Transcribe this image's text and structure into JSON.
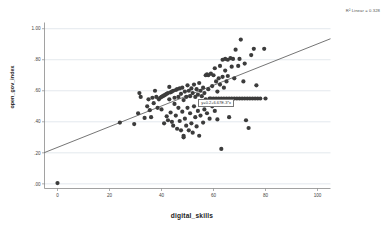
{
  "chart_data": {
    "type": "scatter",
    "title": "",
    "xlabel": "digital_skills",
    "ylabel": "open_gov_index",
    "xlim": [
      -5,
      105
    ],
    "ylim": [
      -0.03,
      1.04
    ],
    "xticks": [
      "0",
      "20",
      "40",
      "60",
      "80",
      "100"
    ],
    "xtick_values": [
      0,
      20,
      40,
      60,
      80,
      100
    ],
    "yticks": [
      "1.00",
      ".80",
      ".60",
      ".40",
      ".20",
      ".00"
    ],
    "ytick_values": [
      1.0,
      0.8,
      0.6,
      0.4,
      0.2,
      0.0
    ],
    "grid": "horizontal",
    "legend": "none",
    "r2_annotation": "R² Linear = 0.328",
    "r2_value": 0.328,
    "fit_equation_label": "y=0.2+6.67E-3*x",
    "fit_line": {
      "intercept": 0.235,
      "slope": 0.00667,
      "x_start": -5,
      "x_end": 105,
      "color": "#3a3a3a"
    },
    "marker": {
      "color": "#3c3c3c",
      "shape": "circle",
      "size": 2.1
    },
    "points": [
      [
        0.0,
        0.005
      ],
      [
        24.0,
        0.395
      ],
      [
        29.5,
        0.385
      ],
      [
        31.0,
        0.455
      ],
      [
        31.5,
        0.585
      ],
      [
        32.0,
        0.56
      ],
      [
        33.5,
        0.425
      ],
      [
        34.5,
        0.5
      ],
      [
        35.0,
        0.545
      ],
      [
        35.5,
        0.475
      ],
      [
        36.0,
        0.43
      ],
      [
        36.5,
        0.555
      ],
      [
        37.0,
        0.52
      ],
      [
        37.5,
        0.6
      ],
      [
        38.0,
        0.56
      ],
      [
        38.5,
        0.49
      ],
      [
        39.0,
        0.545
      ],
      [
        39.5,
        0.555
      ],
      [
        40.0,
        0.56
      ],
      [
        40.0,
        0.48
      ],
      [
        40.5,
        0.565
      ],
      [
        41.0,
        0.57
      ],
      [
        41.0,
        0.39
      ],
      [
        41.5,
        0.575
      ],
      [
        42.0,
        0.58
      ],
      [
        42.0,
        0.435
      ],
      [
        42.5,
        0.585
      ],
      [
        42.5,
        0.41
      ],
      [
        43.0,
        0.545
      ],
      [
        43.0,
        0.625
      ],
      [
        43.5,
        0.59
      ],
      [
        43.5,
        0.46
      ],
      [
        44.0,
        0.595
      ],
      [
        44.0,
        0.4
      ],
      [
        44.5,
        0.6
      ],
      [
        44.5,
        0.375
      ],
      [
        45.0,
        0.555
      ],
      [
        45.0,
        0.515
      ],
      [
        45.5,
        0.605
      ],
      [
        45.5,
        0.44
      ],
      [
        46.0,
        0.61
      ],
      [
        46.0,
        0.355
      ],
      [
        46.5,
        0.56
      ],
      [
        46.5,
        0.49
      ],
      [
        47.0,
        0.615
      ],
      [
        47.0,
        0.405
      ],
      [
        47.5,
        0.58
      ],
      [
        47.5,
        0.345
      ],
      [
        48.0,
        0.62
      ],
      [
        48.0,
        0.465
      ],
      [
        48.5,
        0.54
      ],
      [
        48.5,
        0.31
      ],
      [
        48.5,
        0.3
      ],
      [
        49.0,
        0.595
      ],
      [
        49.0,
        0.42
      ],
      [
        49.5,
        0.56
      ],
      [
        49.5,
        0.375
      ],
      [
        50.0,
        0.635
      ],
      [
        50.0,
        0.49
      ],
      [
        50.5,
        0.6
      ],
      [
        50.5,
        0.345
      ],
      [
        51.0,
        0.565
      ],
      [
        51.0,
        0.455
      ],
      [
        51.5,
        0.615
      ],
      [
        51.5,
        0.39
      ],
      [
        52.0,
        0.585
      ],
      [
        52.0,
        0.33
      ],
      [
        52.5,
        0.64
      ],
      [
        52.5,
        0.5
      ],
      [
        53.0,
        0.56
      ],
      [
        53.0,
        0.43
      ],
      [
        53.5,
        0.61
      ],
      [
        53.5,
        0.37
      ],
      [
        54.0,
        0.575
      ],
      [
        54.0,
        0.47
      ],
      [
        54.5,
        0.65
      ],
      [
        54.5,
        0.31
      ],
      [
        55.0,
        0.6
      ],
      [
        55.0,
        0.44
      ],
      [
        55.5,
        0.565
      ],
      [
        55.5,
        0.52
      ],
      [
        56.0,
        0.62
      ],
      [
        56.0,
        0.395
      ],
      [
        56.5,
        0.585
      ],
      [
        56.5,
        0.48
      ],
      [
        57.0,
        0.7
      ],
      [
        57.0,
        0.545
      ],
      [
        57.5,
        0.705
      ],
      [
        57.5,
        0.455
      ],
      [
        58.0,
        0.7
      ],
      [
        58.0,
        0.61
      ],
      [
        58.5,
        0.55
      ],
      [
        58.5,
        0.42
      ],
      [
        59.0,
        0.71
      ],
      [
        59.0,
        0.55
      ],
      [
        59.5,
        0.63
      ],
      [
        59.5,
        0.5
      ],
      [
        60.0,
        0.7
      ],
      [
        60.0,
        0.55
      ],
      [
        60.5,
        0.745
      ],
      [
        60.5,
        0.47
      ],
      [
        61.0,
        0.55
      ],
      [
        61.0,
        0.66
      ],
      [
        61.5,
        0.595
      ],
      [
        61.5,
        0.415
      ],
      [
        62.0,
        0.55
      ],
      [
        62.0,
        0.68
      ],
      [
        62.5,
        0.76
      ],
      [
        62.5,
        0.64
      ],
      [
        63.0,
        0.55
      ],
      [
        63.0,
        0.225
      ],
      [
        63.5,
        0.8
      ],
      [
        63.5,
        0.69
      ],
      [
        64.0,
        0.55
      ],
      [
        64.0,
        0.62
      ],
      [
        64.5,
        0.805
      ],
      [
        64.5,
        0.73
      ],
      [
        65.0,
        0.55
      ],
      [
        65.0,
        0.66
      ],
      [
        65.5,
        0.8
      ],
      [
        65.5,
        0.695
      ],
      [
        66.0,
        0.55
      ],
      [
        66.0,
        0.43
      ],
      [
        66.5,
        0.81
      ],
      [
        67.0,
        0.55
      ],
      [
        67.0,
        0.755
      ],
      [
        67.5,
        0.805
      ],
      [
        68.0,
        0.55
      ],
      [
        68.0,
        0.68
      ],
      [
        68.5,
        0.865
      ],
      [
        69.0,
        0.55
      ],
      [
        69.5,
        0.76
      ],
      [
        70.0,
        0.55
      ],
      [
        70.0,
        0.805
      ],
      [
        70.5,
        0.93
      ],
      [
        71.0,
        0.55
      ],
      [
        71.5,
        0.66
      ],
      [
        72.0,
        0.55
      ],
      [
        72.0,
        0.775
      ],
      [
        72.5,
        0.41
      ],
      [
        73.0,
        0.55
      ],
      [
        73.5,
        0.36
      ],
      [
        74.0,
        0.55
      ],
      [
        74.5,
        0.83
      ],
      [
        75.0,
        0.55
      ],
      [
        75.5,
        0.87
      ],
      [
        76.0,
        0.55
      ],
      [
        76.5,
        0.635
      ],
      [
        77.0,
        0.55
      ],
      [
        78.0,
        0.55
      ],
      [
        79.5,
        0.87
      ],
      [
        80.0,
        0.55
      ]
    ]
  },
  "annotations": {
    "r2_text": "R² Linear = 0.328",
    "equation_text": "y=0.2+6.67E-3*x"
  }
}
